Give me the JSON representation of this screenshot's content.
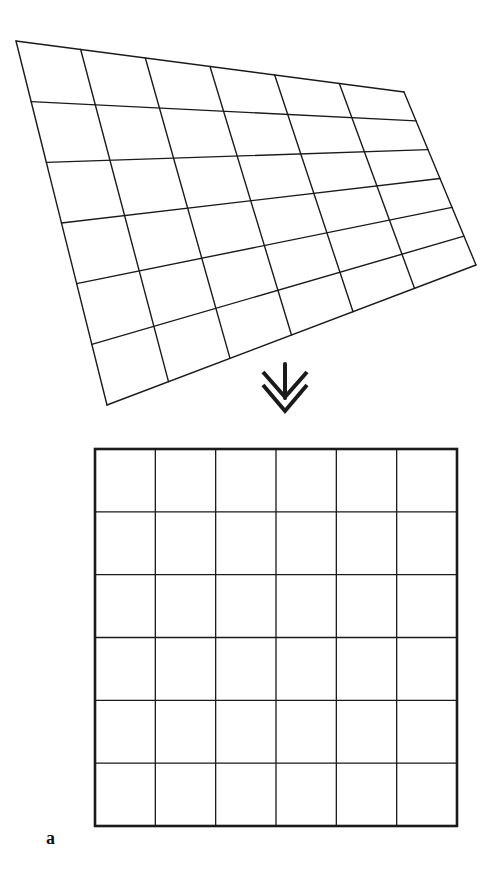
{
  "figure": {
    "panel_label": "a",
    "background": "#ffffff",
    "line_color": "#1a1a1a",
    "distorted_grid": {
      "description": "perspective-distorted 6x6 grid (quadrilateral)",
      "rows": 6,
      "cols": 6,
      "corners": {
        "top_left": [
          16,
          41
        ],
        "top_right": [
          404,
          92
        ],
        "bottom_right": [
          476,
          265
        ],
        "bottom_left": [
          107,
          405
        ]
      },
      "line_width": 1.4
    },
    "arrow": {
      "icon": "double-chevron-down-arrow",
      "direction": "down",
      "stem": [
        [
          285,
          364
        ],
        [
          285,
          398
        ]
      ],
      "chevrons": [
        [
          [
            263,
            372
          ],
          [
            285,
            397
          ],
          [
            307,
            372
          ]
        ],
        [
          [
            263,
            385
          ],
          [
            285,
            411
          ],
          [
            307,
            385
          ]
        ]
      ],
      "stroke_width": 4
    },
    "rectified_grid": {
      "description": "rectified square 6x6 grid",
      "rows": 6,
      "cols": 6,
      "x": 95,
      "y": 449,
      "width": 362,
      "height": 377,
      "border_width": 2.6,
      "inner_line_width": 1.3
    }
  }
}
